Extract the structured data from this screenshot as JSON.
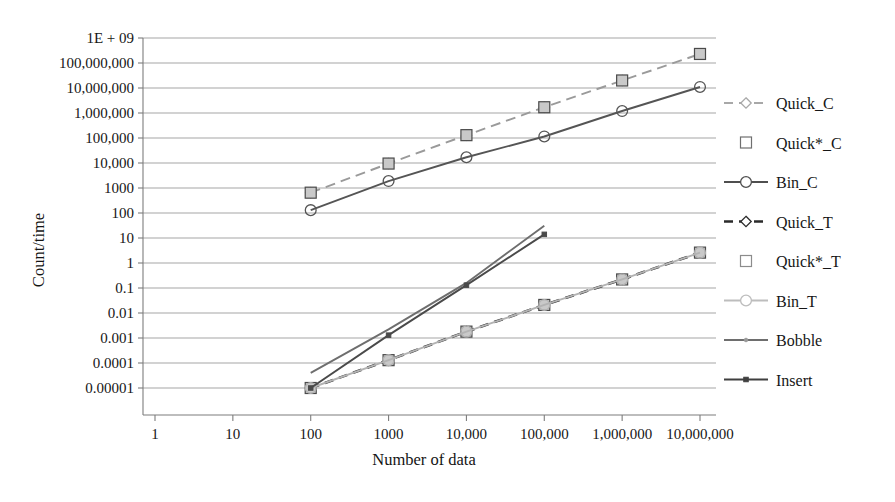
{
  "chart_data": {
    "type": "line",
    "title": "",
    "xlabel": "Number of data",
    "ylabel": "Count/time",
    "xscale": "log",
    "yscale": "log",
    "grid": true,
    "legend_position": "right",
    "xlim": [
      1,
      10000000
    ],
    "ylim": [
      1e-05,
      1000000000
    ],
    "x_tick_labels": [
      "1",
      "10",
      "100",
      "1000",
      "10,000",
      "100,000",
      "1,000,000",
      "10,000,000"
    ],
    "x_tick_values": [
      1,
      10,
      100,
      1000,
      10000,
      100000,
      1000000,
      10000000
    ],
    "y_tick_labels": [
      "1E + 09",
      "100,000,000",
      "10,000,000",
      "1,000,000",
      "100,000",
      "10,000",
      "1000",
      "100",
      "10",
      "1",
      "0.1",
      "0.01",
      "0.001",
      "0.0001",
      "0.00001"
    ],
    "y_tick_values": [
      1000000000,
      100000000,
      10000000,
      1000000,
      100000,
      10000,
      1000,
      100,
      10,
      1,
      0.1,
      0.01,
      0.001,
      0.0001,
      1e-05
    ],
    "categories": [
      100,
      1000,
      10000,
      100000,
      1000000,
      10000000
    ],
    "series": [
      {
        "name": "Quick_C",
        "marker": "diamond",
        "line": "dashed",
        "color": "#9a9a9a",
        "x": [
          100,
          1000,
          10000,
          100000,
          1000000,
          10000000
        ],
        "values": [
          650,
          9500,
          130000,
          1700000,
          20000000,
          230000000
        ]
      },
      {
        "name": "Quick*_C",
        "marker": "square",
        "line": "none",
        "color": "#868686",
        "x": [
          100,
          1000,
          10000,
          100000,
          1000000,
          10000000
        ],
        "values": [
          650,
          9500,
          130000,
          1700000,
          20000000,
          230000000
        ]
      },
      {
        "name": "Bin_C",
        "marker": "circle",
        "line": "solid",
        "color": "#555555",
        "x": [
          100,
          1000,
          10000,
          100000,
          1000000,
          10000000
        ],
        "values": [
          130,
          1900,
          17000,
          115000,
          1200000,
          11000000
        ]
      },
      {
        "name": "Quick_T",
        "marker": "diamond",
        "line": "dashed",
        "color": "#2b2b2b",
        "x": [
          100,
          1000,
          10000,
          100000,
          1000000,
          10000000
        ],
        "values": [
          1e-05,
          0.00013,
          0.0018,
          0.021,
          0.22,
          2.6
        ]
      },
      {
        "name": "Quick*_T",
        "marker": "square",
        "line": "none",
        "color": "#8a8a8a",
        "x": [
          100,
          1000,
          10000,
          100000,
          1000000,
          10000000
        ],
        "values": [
          1e-05,
          0.00013,
          0.0018,
          0.021,
          0.22,
          2.6
        ]
      },
      {
        "name": "Bin_T",
        "marker": "circle",
        "line": "solid",
        "color": "#b3b3b3",
        "x": [
          100,
          1000,
          10000,
          100000,
          1000000,
          10000000
        ],
        "values": [
          1e-05,
          0.00013,
          0.0018,
          0.021,
          0.22,
          2.6
        ]
      },
      {
        "name": "Bobble",
        "marker": "none",
        "line": "solid",
        "color": "#6e6e6e",
        "x": [
          100,
          1000,
          10000,
          100000
        ],
        "values": [
          4e-05,
          0.0022,
          0.16,
          31
        ]
      },
      {
        "name": "Insert",
        "marker": "small-square",
        "line": "solid",
        "color": "#4a4a4a",
        "x": [
          100,
          1000,
          10000,
          100000
        ],
        "values": [
          1e-05,
          0.0013,
          0.13,
          14
        ]
      }
    ],
    "legend_entries": [
      {
        "label": "Quick_C",
        "marker": "diamond",
        "line": "dashed",
        "color": "#a8a8a8"
      },
      {
        "label": "Quick*_C",
        "marker": "square",
        "line": "none",
        "color": "#6f6f6f"
      },
      {
        "label": "Bin_C",
        "marker": "circle",
        "line": "solid",
        "color": "#4f4f4f"
      },
      {
        "label": "Quick_T",
        "marker": "diamond",
        "line": "dashed",
        "color": "#2b2b2b"
      },
      {
        "label": "Quick*_T",
        "marker": "square",
        "line": "none",
        "color": "#8c8c8c"
      },
      {
        "label": "Bin_T",
        "marker": "circle",
        "line": "solid",
        "color": "#bdbdbd"
      },
      {
        "label": "Bobble",
        "marker": "tiny",
        "line": "solid",
        "color": "#6e6e6e"
      },
      {
        "label": "Insert",
        "marker": "small-square",
        "line": "solid",
        "color": "#3f3f3f"
      }
    ]
  },
  "colors": {
    "background": "#ffffff",
    "gridline": "#9b9b9b",
    "axis": "#7d7d7d",
    "text": "#161616"
  }
}
